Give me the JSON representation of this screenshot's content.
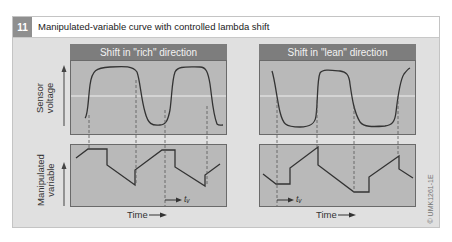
{
  "figure": {
    "number": "11",
    "title": "Manipulated-variable curve with controlled lambda shift",
    "code": "© UMK1261-1E"
  },
  "axes": {
    "sensor_label_line1": "Sensor",
    "sensor_label_line2": "voltage",
    "manip_label_line1": "Manipulated",
    "manip_label_line2": "variable",
    "time_label": "Time"
  },
  "panels": [
    {
      "title": "Shift in \"rich\" direction",
      "delay_label": "tᵥ"
    },
    {
      "title": "Shift in \"lean\" direction",
      "delay_label": "tᵥ"
    }
  ],
  "colors": {
    "background": "#e0e0e0",
    "plot_fill": "#b9b9b9",
    "header_fill": "#7d7d7d",
    "curve": "#333333",
    "reference_line": "#f0f0f0"
  }
}
